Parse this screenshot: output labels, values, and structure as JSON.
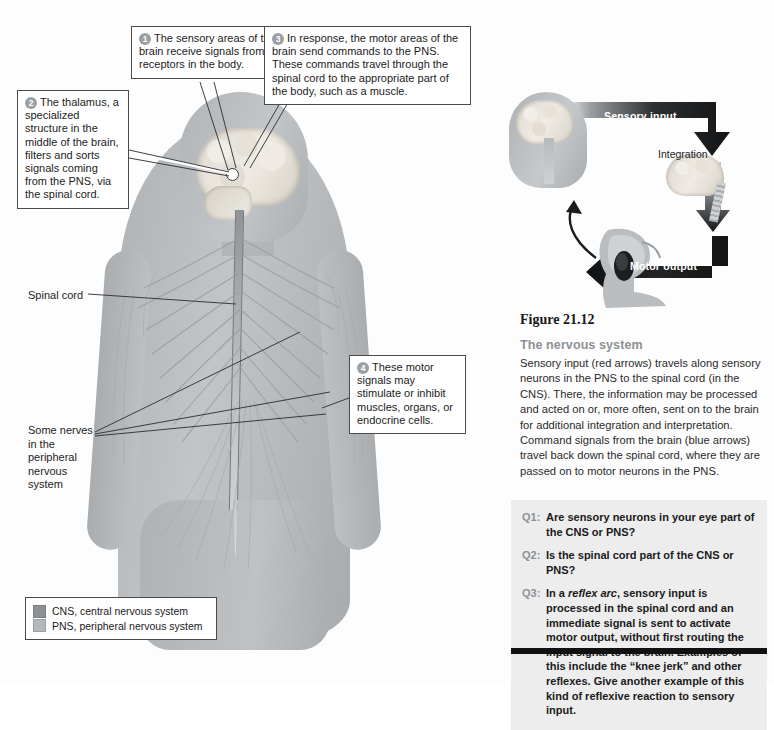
{
  "figure": {
    "number": "Figure 21.12",
    "title": "The nervous system",
    "caption": "Sensory input (red arrows) travels along sensory neurons in the PNS to the spinal cord (in the CNS). There, the information may be processed and acted on or, more often, sent on to the brain for additional integration and interpretation. Command signals from the brain (blue arrows) travel back down the spinal cord, where they are passed on to motor neurons in the PNS."
  },
  "callouts": [
    {
      "number": "1",
      "text": "The sensory areas of the brain receive signals from the receptors in the body."
    },
    {
      "number": "2",
      "text": "The thalamus, a specialized structure in the middle of the brain, filters and sorts signals coming from the PNS, via the spinal cord."
    },
    {
      "number": "3",
      "text": "In response, the motor areas of the brain send commands to the PNS. These commands travel through the spinal cord to the appropriate part of the body, such as a muscle."
    },
    {
      "number": "4",
      "text": "These motor signals may stimulate or inhibit muscles, organs, or endocrine cells."
    }
  ],
  "labels": {
    "spinal_cord": "Spinal cord",
    "peripheral_nerves": "Some nerves in the peripheral nervous system"
  },
  "legend": {
    "items": [
      {
        "label": "CNS, central nervous system",
        "color": "#8d9194"
      },
      {
        "label": "PNS, peripheral nervous system",
        "color": "#b4b8ba"
      }
    ]
  },
  "cycle": {
    "sensory_input": "Sensory input",
    "integration": "Integration",
    "motor_output": "Motor output"
  },
  "questions": [
    {
      "tag": "Q1:",
      "text": "Are sensory neurons in your eye part of the CNS or PNS?"
    },
    {
      "tag": "Q2:",
      "text": "Is the spinal cord part of the CNS or PNS?"
    },
    {
      "tag": "Q3:",
      "text_before": "In a ",
      "text_italic": "reflex arc",
      "text_after": ", sensory input is processed in the spinal cord and an immediate signal is sent to activate motor output, without first routing the input signal to the brain. Examples of this include the “knee jerk” and other reflexes. Give another example of this kind of reflexive reaction to sensory input."
    }
  ],
  "colors": {
    "accent_gray": "#8d9196",
    "qbox_bg": "#ededed",
    "rule": "#111111"
  }
}
